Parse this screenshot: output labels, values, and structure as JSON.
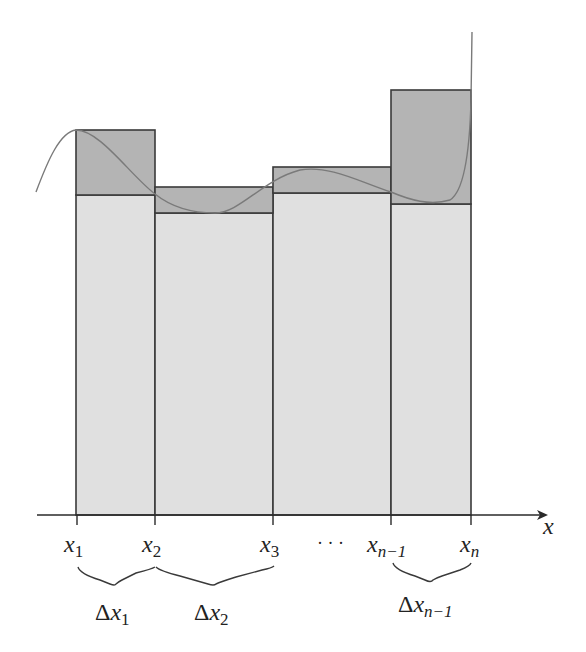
{
  "diagram": {
    "colors": {
      "upper_fill": "#b4b4b4",
      "lower_fill": "#e0e0e0",
      "stroke": "#3a3a3a",
      "curve": "#7a7a7a",
      "background": "#ffffff"
    },
    "axis": {
      "label": "x"
    },
    "ticks": [
      {
        "base": "x",
        "sub": "1"
      },
      {
        "base": "x",
        "sub": "2"
      },
      {
        "base": "x",
        "sub": "3"
      },
      {
        "base": "x",
        "sub": "n−1"
      },
      {
        "base": "x",
        "sub": "n"
      }
    ],
    "ellipsis": "· · ·",
    "braces": [
      {
        "delta": "Δ",
        "base": "x",
        "sub": "1"
      },
      {
        "delta": "Δ",
        "base": "x",
        "sub": "2"
      },
      {
        "delta": "Δ",
        "base": "x",
        "sub": "n−1"
      }
    ],
    "rectangles": [
      {
        "x_from": "x1",
        "x_to": "x2",
        "upper_top_px": 130,
        "lower_top_px": 195
      },
      {
        "x_from": "x2",
        "x_to": "x3",
        "upper_top_px": 187,
        "lower_top_px": 213
      },
      {
        "x_from": "x3",
        "x_to": "...",
        "upper_top_px": 167,
        "lower_top_px": 193
      },
      {
        "x_from": "x_{n-1}",
        "x_to": "x_n",
        "upper_top_px": 90,
        "lower_top_px": 204
      }
    ]
  }
}
